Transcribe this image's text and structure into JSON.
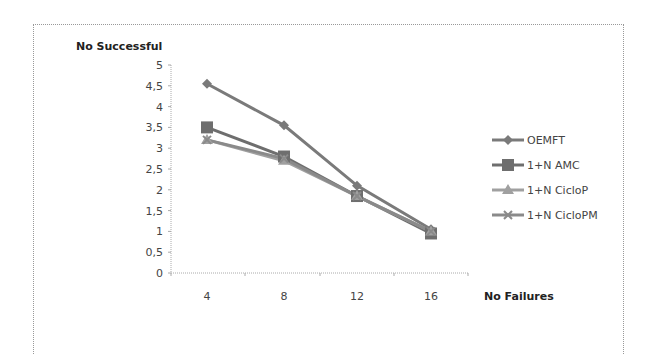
{
  "chart_data": {
    "type": "line",
    "title": "",
    "xlabel": "No Failures",
    "ylabel": "No Successful",
    "x": [
      4,
      8,
      12,
      16
    ],
    "categories": [
      "4",
      "8",
      "12",
      "16"
    ],
    "yticks": [
      "0",
      "0,5",
      "1",
      "1,5",
      "2",
      "2,5",
      "3",
      "3,5",
      "4",
      "4,5",
      "5"
    ],
    "ylim": [
      0,
      5
    ],
    "grid": false,
    "legend_position": "right",
    "series": [
      {
        "name": "OEMFT",
        "marker": "diamond",
        "color": "#7a7a7a",
        "values": [
          4.55,
          3.55,
          2.1,
          1.05
        ]
      },
      {
        "name": "1+N AMC",
        "marker": "square",
        "color": "#6e6e6e",
        "values": [
          3.5,
          2.8,
          1.85,
          0.95
        ]
      },
      {
        "name": "1+N CicloP",
        "marker": "triangle",
        "color": "#a0a0a0",
        "values": [
          3.2,
          2.7,
          1.85,
          1.0
        ]
      },
      {
        "name": "1+N CicloPM",
        "marker": "x",
        "color": "#8a8a8a",
        "values": [
          3.2,
          2.75,
          1.85,
          1.0
        ]
      }
    ]
  }
}
